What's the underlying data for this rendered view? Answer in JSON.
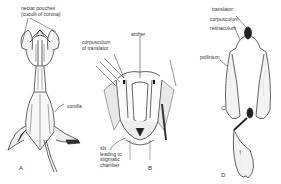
{
  "diagram": {
    "panels": [
      {
        "id": "A",
        "letter": "A",
        "labels": {
          "nectar_pouches_1": "nectar pouches",
          "nectar_pouches_2": "(cuculli of corona)",
          "corolla": "corolla"
        }
      },
      {
        "id": "B",
        "letter": "B",
        "labels": {
          "corpusculum_1": "corpusculum",
          "corpusculum_2": "of translator",
          "anther": "anther",
          "slit_1": "slit",
          "slit_2": "leading to",
          "slit_3": "stigmatic",
          "slit_4": "chamber"
        }
      },
      {
        "id": "C",
        "letter": "C",
        "labels": {
          "translator": "translator:",
          "corpusculum": "corpusculum",
          "retinaculum": "retinaculum",
          "pollinium": "pollinium"
        }
      },
      {
        "id": "D",
        "letter": "D",
        "labels": {}
      }
    ],
    "colors": {
      "ink": "#222222",
      "stipple": "#9a9a9a",
      "background": "#ffffff"
    }
  }
}
